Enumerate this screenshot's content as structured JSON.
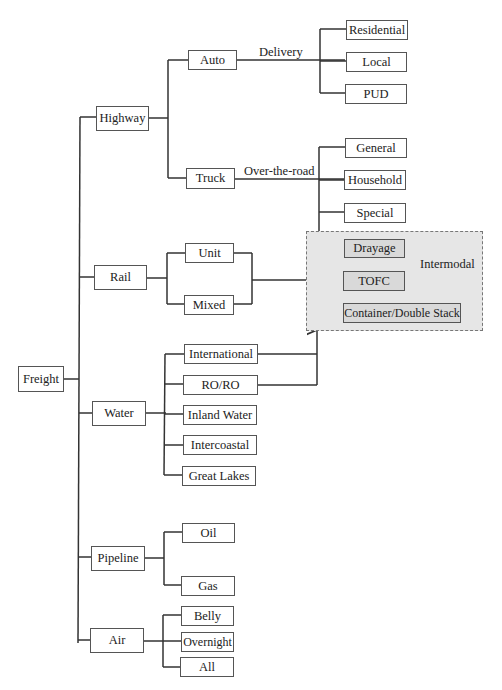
{
  "diagram": {
    "root": "Freight",
    "modes": {
      "highway": {
        "label": "Highway",
        "auto": {
          "label": "Auto",
          "edge_label": "Delivery",
          "children": [
            "Residential",
            "Local",
            "PUD"
          ]
        },
        "truck": {
          "label": "Truck",
          "edge_label": "Over-the-road",
          "children": [
            "General",
            "Household",
            "Special"
          ]
        }
      },
      "rail": {
        "label": "Rail",
        "children": [
          "Unit",
          "Mixed"
        ]
      },
      "water": {
        "label": "Water",
        "children": [
          "International",
          "RO/RO",
          "Inland Water",
          "Intercoastal",
          "Great Lakes"
        ]
      },
      "pipeline": {
        "label": "Pipeline",
        "children": [
          "Oil",
          "Gas"
        ]
      },
      "air": {
        "label": "Air",
        "children": [
          "Belly",
          "Overnight",
          "All"
        ]
      }
    },
    "intermodal": {
      "label": "Intermodal",
      "children": [
        "Drayage",
        "TOFC",
        "Container/Double Stack"
      ]
    }
  }
}
